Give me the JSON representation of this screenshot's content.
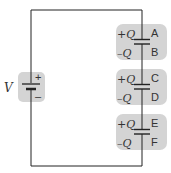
{
  "diagram": {
    "battery": {
      "label": "V",
      "plus": "+",
      "minus": "–"
    },
    "capacitors": [
      {
        "top_charge": "+Q",
        "bottom_charge": "–Q",
        "top_plate": "A",
        "bottom_plate": "B"
      },
      {
        "top_charge": "+Q",
        "bottom_charge": "–Q",
        "top_plate": "C",
        "bottom_plate": "D"
      },
      {
        "top_charge": "+Q",
        "bottom_charge": "–Q",
        "top_plate": "E",
        "bottom_plate": "F"
      }
    ],
    "colors": {
      "wire": "#222222",
      "highlight": "#d2d2d2",
      "text": "#333333"
    }
  }
}
